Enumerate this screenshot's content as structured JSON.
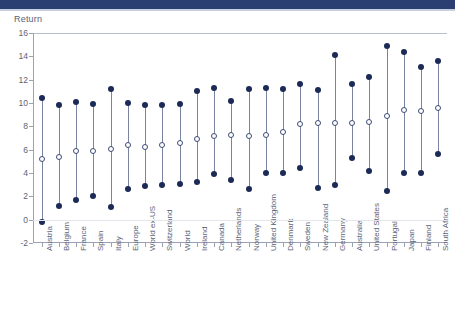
{
  "header": {
    "band_color": "#2b3f72"
  },
  "chart_data": {
    "type": "scatter",
    "title": "",
    "ylabel": "Return",
    "xlabel": "",
    "ylim": [
      -2,
      16
    ],
    "yticks": [
      -2,
      0,
      2,
      4,
      6,
      8,
      10,
      12,
      14,
      16
    ],
    "ytick_labels": [
      "-2",
      "0",
      "2",
      "4",
      "6",
      "8",
      "10",
      "12",
      "14",
      "16"
    ],
    "grid": false,
    "legend_position": "none",
    "marker_filled_color": "#1b2a56",
    "marker_hollow_color": "#3d4a76",
    "connector_color": "#7a84a0",
    "categories": [
      "Austria",
      "Belgium",
      "France",
      "Spain",
      "Italy",
      "Europe",
      "World ex-US",
      "Switzerland",
      "World",
      "Ireland",
      "Canada",
      "Netherlands",
      "Norway",
      "United Kingdom",
      "Denmark",
      "Sweden",
      "New Zealand",
      "Germany",
      "Australia",
      "United States",
      "Portugal",
      "Japan",
      "Finland",
      "South Africa"
    ],
    "series": [
      {
        "name": "High",
        "marker": "filled",
        "values": [
          10.4,
          9.8,
          10.1,
          9.9,
          11.2,
          10.0,
          9.8,
          9.8,
          9.9,
          11.0,
          11.3,
          10.2,
          11.2,
          11.3,
          11.2,
          11.6,
          11.1,
          14.1,
          11.6,
          12.2,
          14.9,
          14.4,
          13.1,
          13.6
        ]
      },
      {
        "name": "Average",
        "marker": "hollow",
        "values": [
          5.2,
          5.4,
          5.9,
          5.9,
          6.1,
          6.4,
          6.2,
          6.4,
          6.6,
          6.9,
          7.2,
          7.3,
          7.2,
          7.3,
          7.5,
          8.2,
          8.3,
          8.3,
          8.3,
          8.4,
          8.9,
          9.4,
          9.3,
          9.6
        ]
      },
      {
        "name": "Low",
        "marker": "filled",
        "values": [
          -0.2,
          1.2,
          1.7,
          2.0,
          1.1,
          2.6,
          2.9,
          3.0,
          3.1,
          3.2,
          3.9,
          3.4,
          2.6,
          4.0,
          4.0,
          4.4,
          2.7,
          3.0,
          5.3,
          4.2,
          2.5,
          4.0,
          4.0,
          5.6
        ]
      }
    ]
  }
}
